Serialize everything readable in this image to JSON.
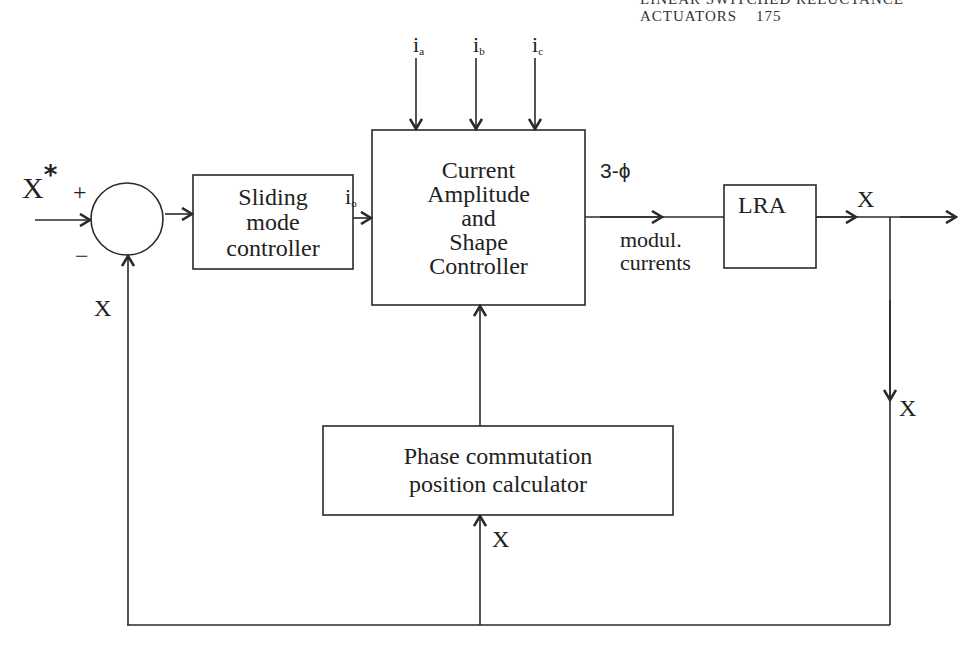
{
  "header": {
    "running_title": "LINEAR SWITCHED RELUCTANCE ACTUATORS",
    "page_number": "175"
  },
  "diagram": {
    "type": "control block diagram",
    "blocks": {
      "summing_junction": {
        "plus_sign": "+",
        "minus_sign": "−"
      },
      "sliding_mode": {
        "line1": "Sliding",
        "line2": "mode",
        "line3": "controller"
      },
      "current_controller": {
        "line1": "Current",
        "line2": "Amplitude",
        "line3": "and",
        "line4": "Shape",
        "line5": "Controller"
      },
      "lra": {
        "label": "LRA"
      },
      "phase_calculator": {
        "line1": "Phase commutation",
        "line2": "position calculator"
      }
    },
    "signals": {
      "reference_input": {
        "base": "X",
        "superscript": "*"
      },
      "feedback_left": "X",
      "controller_output": {
        "base": "i",
        "subscript": "o"
      },
      "phase_inputs": [
        {
          "base": "i",
          "subscript": "a"
        },
        {
          "base": "i",
          "subscript": "b"
        },
        {
          "base": "i",
          "subscript": "c"
        }
      ],
      "three_phase_label": "3-ϕ",
      "modulated_currents": {
        "line1": "modul.",
        "line2": "currents"
      },
      "output": "X",
      "branch_down": "X",
      "phase_calc_input": "X"
    },
    "colors": {
      "line": "#2a2a2a",
      "background": "#ffffff"
    }
  }
}
